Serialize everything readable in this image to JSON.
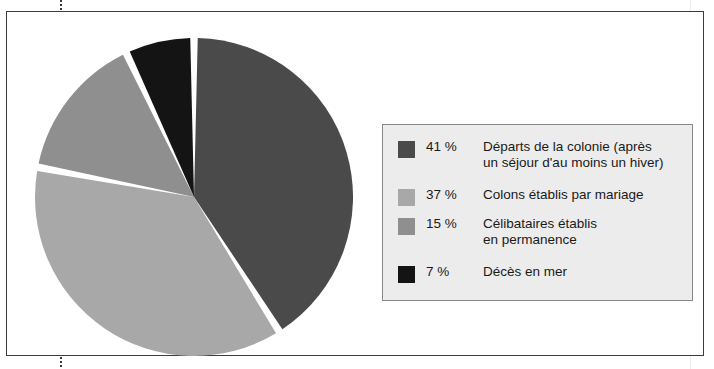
{
  "figure": {
    "cut_off_text_above": "",
    "background_color": "#ffffff",
    "frame_color": "#3d3d3d"
  },
  "chart_data": {
    "type": "pie",
    "title": "",
    "subtitle": "",
    "xlabel": "",
    "ylabel": "",
    "grid": false,
    "legend_position": "right",
    "start_angle_deg": 0,
    "direction": "clockwise",
    "categories": [
      "Départs de la colonie (après un séjour d'au moins un hiver)",
      "Colons établis par mariage",
      "Célibataires établis en permanence",
      "Décès en mer"
    ],
    "values": [
      41,
      37,
      15,
      7
    ],
    "value_unit": "%",
    "colors": [
      "#4a4a4a",
      "#a8a8a8",
      "#8f8f8f",
      "#141414"
    ],
    "slice_gap_color": "#ffffff",
    "slices": [
      {
        "label": "Départs de la colonie (après un séjour d'au moins un hiver)",
        "value": 41,
        "color": "#4a4a4a"
      },
      {
        "label": "Colons établis par mariage",
        "value": 37,
        "color": "#a8a8a8"
      },
      {
        "label": "Célibataires établis en permanence",
        "value": 15,
        "color": "#8f8f8f"
      },
      {
        "label": "Décès en mer",
        "value": 7,
        "color": "#141414"
      }
    ]
  },
  "legend": {
    "background_color": "#ececec",
    "border_color": "#888888",
    "items": [
      {
        "percent": "41 %",
        "label": "Départs de la colonie (après\nun séjour d'au moins un hiver)",
        "color": "#4a4a4a"
      },
      {
        "percent": "37 %",
        "label": "Colons établis par mariage",
        "color": "#a8a8a8"
      },
      {
        "percent": "15 %",
        "label": "Célibataires établis\nen permanence",
        "color": "#8f8f8f"
      },
      {
        "percent": "7 %",
        "label": "Décès en mer",
        "color": "#141414"
      }
    ]
  }
}
